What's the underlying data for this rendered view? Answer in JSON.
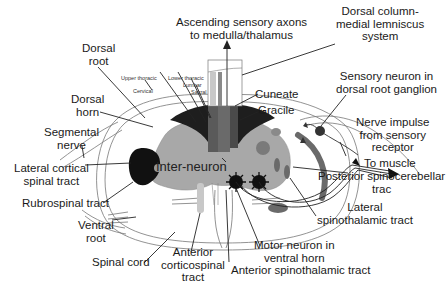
{
  "diagram": {
    "type": "spinal-cord-cross-section",
    "colors": {
      "outline": "#555555",
      "dark_tract": "#1a1a1a",
      "gray_matter": "#a8a8a8",
      "dorsal_column": "#4a4a4a",
      "medium_gray": "#7a7a7a",
      "light_gray": "#c8c8c8",
      "background": "#ffffff"
    },
    "labels": {
      "ascending": "Ascending sensory axons\nto medulla/thalamus",
      "ascending_l1": "Ascending sensory axons",
      "ascending_l2": "to medulla/thalamus",
      "dorsal_column_l1": "Dorsal column-",
      "dorsal_column_l2": "medial lemniscus",
      "dorsal_column_l3": "system",
      "dorsal_root_l1": "Dorsal",
      "dorsal_root_l2": "root",
      "upper_thoracic": "Upper thoracic",
      "cervical": "Cervical",
      "lower_thoracic": "Lower thoracic",
      "lumbar": "Lumbar",
      "sacral": "Sacral",
      "dorsal_horn_l1": "Dorsal",
      "dorsal_horn_l2": "horn",
      "sensory_neuron_l1": "Sensory neuron in",
      "sensory_neuron_l2": "dorsal root ganglion",
      "cuneate": "Cuneate",
      "gracile": "Gracile",
      "segmental_l1": "Segmental",
      "segmental_l2": "nerve",
      "nerve_impulse_l1": "Nerve impulse",
      "nerve_impulse_l2": "from sensory",
      "nerve_impulse_l3": "receptor",
      "lateral_cortical_l1": "Lateral cortical",
      "lateral_cortical_l2": "spinal tract",
      "interneuron": "Inter-neuron",
      "to_muscle": "To muscle",
      "posterior_spino_l1": "Posterior spinocerebellar",
      "posterior_spino_l2": "trac",
      "rubrospinal": "Rubrospinal tract",
      "lateral_spino_l1": "Lateral",
      "lateral_spino_l2": "spinothalamic tract",
      "ventral_root_l1": "Ventral",
      "ventral_root_l2": "root",
      "spinal_cord": "Spinal cord",
      "motor_neuron_l1": "Motor neuron in",
      "motor_neuron_l2": "ventral horn",
      "anterior_cortico_l1": "Anterior",
      "anterior_cortico_l2": "corticospinal",
      "anterior_cortico_l3": "tract",
      "anterior_spino": "Anterior spinothalamic tract"
    }
  }
}
